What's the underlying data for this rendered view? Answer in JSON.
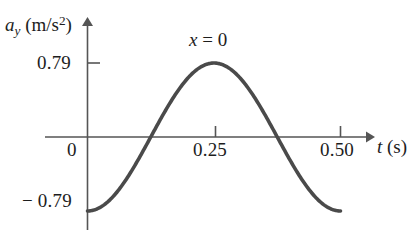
{
  "figure": {
    "background_color": "#ffffff",
    "axis_color": "#555555",
    "curve_color": "#4a4a4a",
    "text_color": "#1d1d1d",
    "y_axis_title": {
      "symbol": "a",
      "subscript": "y",
      "units_open": " (m/s",
      "units_exponent": "2",
      "units_close": ")"
    },
    "x_axis_title": {
      "symbol": "t",
      "units": " (s)"
    },
    "annotation": {
      "symbol": "x",
      "equals": " = 0"
    },
    "y_ticks": [
      {
        "value": 0.79,
        "label": "0.79"
      },
      {
        "value": -0.79,
        "label": "− 0.79"
      }
    ],
    "x_ticks": [
      {
        "value": 0,
        "label": "0"
      },
      {
        "value": 0.25,
        "label": "0.25"
      },
      {
        "value": 0.5,
        "label": "0.50"
      }
    ]
  },
  "chart_data": {
    "type": "line",
    "title": "",
    "subtitle": "",
    "annotations": [
      {
        "text": "x = 0",
        "x": 0.25,
        "y": 1.02
      }
    ],
    "xlabel": "t (s)",
    "ylabel": "a_y (m/s^2)",
    "xlim": [
      0,
      0.5
    ],
    "ylim": [
      -0.79,
      0.79
    ],
    "xticks": [
      0,
      0.25,
      0.5
    ],
    "xticklabels": [
      "0",
      "0.25",
      "0.50"
    ],
    "yticks": [
      -0.79,
      0.79
    ],
    "yticklabels": [
      "− 0.79",
      "0.79"
    ],
    "grid": false,
    "legend": null,
    "amplitude": 0.79,
    "period": 0.5,
    "equation": "a_y = -0.79 * cos(2*pi*t/0.5)",
    "series": [
      {
        "name": "a_y",
        "x": [
          0.0,
          0.025,
          0.05,
          0.075,
          0.1,
          0.125,
          0.15,
          0.175,
          0.2,
          0.225,
          0.25,
          0.275,
          0.3,
          0.325,
          0.35,
          0.375,
          0.4,
          0.425,
          0.45,
          0.475,
          0.5
        ],
        "values": [
          -0.79,
          -0.75,
          -0.64,
          -0.46,
          -0.24,
          0.0,
          0.24,
          0.46,
          0.64,
          0.75,
          0.79,
          0.75,
          0.64,
          0.46,
          0.24,
          0.0,
          -0.24,
          -0.46,
          -0.64,
          -0.75,
          -0.79
        ]
      }
    ]
  }
}
